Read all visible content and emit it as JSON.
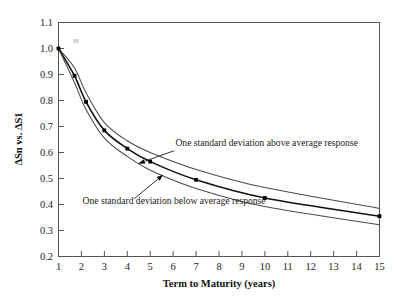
{
  "chart_data": {
    "type": "line",
    "title": "",
    "xlabel": "Term to Maturity (years)",
    "ylabel": "ΔSn vs. ΔS1",
    "xlim": [
      1,
      15
    ],
    "ylim": [
      0.2,
      1.1
    ],
    "xticks": [
      "1",
      "2",
      "3",
      "4",
      "5",
      "6",
      "7",
      "8",
      "9",
      "10",
      "11",
      "12",
      "13",
      "14",
      "15"
    ],
    "yticks": [
      "0.2",
      "0.3",
      "0.4",
      "0.5",
      "0.6",
      "0.7",
      "0.8",
      "0.9",
      "1.0",
      "1.1"
    ],
    "grid": false,
    "legend": "none",
    "x": [
      1,
      1.7,
      2.2,
      3,
      4,
      5,
      7,
      10,
      15
    ],
    "series": [
      {
        "name": "One standard deviation above average response",
        "values": [
          1.0,
          0.925,
          0.83,
          0.715,
          0.645,
          0.6,
          0.535,
          0.465,
          0.385
        ]
      },
      {
        "name": "Average response",
        "values": [
          1.0,
          0.895,
          0.795,
          0.685,
          0.615,
          0.565,
          0.495,
          0.425,
          0.355
        ],
        "markers": true
      },
      {
        "name": "One standard deviation below average response",
        "values": [
          1.0,
          0.868,
          0.765,
          0.655,
          0.585,
          0.532,
          0.462,
          0.392,
          0.322
        ]
      }
    ],
    "annotations": [
      {
        "text": "One standard deviation above average response",
        "text_x": 6.1,
        "text_y": 0.625,
        "arrow_from_x": 6.05,
        "arrow_from_y": 0.607,
        "arrow_to_x": 4.5,
        "arrow_to_y": 0.558
      },
      {
        "text": "One standard deviation below average response",
        "text_x": 2.05,
        "text_y": 0.402,
        "arrow_from_x": 4.3,
        "arrow_from_y": 0.422,
        "arrow_to_x": 5.55,
        "arrow_to_y": 0.513
      }
    ]
  },
  "axes": {
    "x_title": "Term to Maturity (years)",
    "y_title": "ΔSn vs. ΔS1"
  }
}
